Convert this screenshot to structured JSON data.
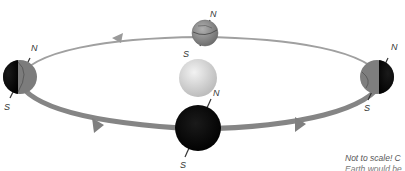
{
  "diagram": {
    "orbit": {
      "color_back": "#9a9a9a",
      "color_front": "#7f7f7f",
      "direction": "counterclockwise (viewed from above)",
      "arrows": [
        "top-left pointing left",
        "top-right pointing left",
        "bottom-left pointing right",
        "bottom-right pointing right"
      ]
    },
    "sun": {
      "label": "",
      "color": "#d6d6d6"
    },
    "earths": [
      {
        "position": "top",
        "north_label": "N",
        "south_label": "S"
      },
      {
        "position": "left",
        "north_label": "N",
        "south_label": "S"
      },
      {
        "position": "right",
        "north_label": "N",
        "south_label": "S"
      },
      {
        "position": "bottom",
        "north_label": "N",
        "south_label": "S"
      }
    ],
    "note_line1": "Not to scale! C",
    "note_line2": "Earth would be"
  }
}
